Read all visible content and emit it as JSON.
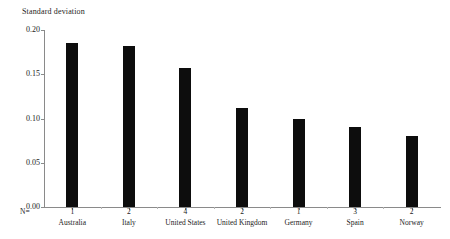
{
  "chart_data": {
    "type": "bar",
    "title": "",
    "ylabel": "Standard deviation",
    "xlabel": "",
    "categories": [
      "Australia",
      "Italy",
      "United States",
      "United Kingdom",
      "Germany",
      "Spain",
      "Norway"
    ],
    "values": [
      0.185,
      0.182,
      0.157,
      0.112,
      0.1,
      0.09,
      0.08
    ],
    "counts_label": "N=",
    "counts": [
      1,
      2,
      4,
      2,
      1,
      3,
      2
    ],
    "ylim": [
      0.0,
      0.2
    ],
    "yticks": [
      "0.00",
      "0.05",
      "0.10",
      "0.15",
      "0.20"
    ],
    "ytick_values": [
      0.0,
      0.05,
      0.1,
      0.15,
      0.2
    ],
    "grid": false,
    "legend": "none",
    "bar_color": "#0d0d0d",
    "axis_color": "#8a8a8a"
  }
}
